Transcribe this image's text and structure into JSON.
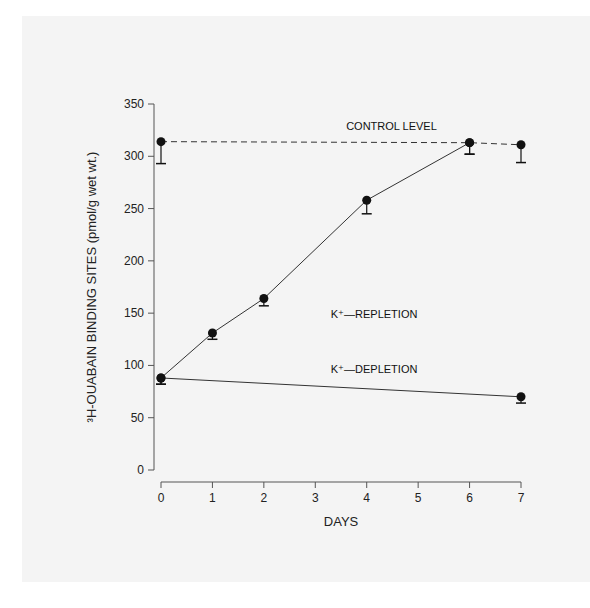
{
  "chart_data": {
    "type": "line",
    "title": "",
    "xlabel": "DAYS",
    "ylabel": "³H-OUABAIN BINDING SITES (pmol/g wet wt.)",
    "xlim": [
      0,
      7
    ],
    "ylim": [
      0,
      350
    ],
    "xticks": [
      0,
      1,
      2,
      3,
      4,
      5,
      6,
      7
    ],
    "yticks": [
      0,
      50,
      100,
      150,
      200,
      250,
      300,
      350
    ],
    "grid": false,
    "series": [
      {
        "name": "CONTROL LEVEL",
        "style": "dashed",
        "x": [
          0,
          6,
          7
        ],
        "y": [
          314,
          313,
          311
        ],
        "err_low": [
          293,
          302,
          294
        ]
      },
      {
        "name": "K⁺—REPLETION",
        "style": "solid",
        "x": [
          0,
          1,
          2,
          4,
          6
        ],
        "y": [
          88,
          131,
          164,
          258,
          313
        ],
        "err_low": [
          82,
          125,
          157,
          245,
          302
        ]
      },
      {
        "name": "K⁺—DEPLETION",
        "style": "solid",
        "x": [
          0,
          7
        ],
        "y": [
          88,
          70
        ],
        "err_low": [
          82,
          64
        ]
      }
    ],
    "annotations": [
      {
        "text": "CONTROL LEVEL",
        "x": 3.6,
        "y": 325
      },
      {
        "text": "K⁺—REPLETION",
        "x": 3.3,
        "y": 145
      },
      {
        "text": "K⁺—DEPLETION",
        "x": 3.3,
        "y": 93
      }
    ]
  }
}
